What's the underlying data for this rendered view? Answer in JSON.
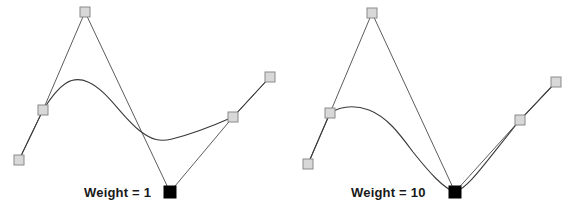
{
  "figure": {
    "background_color": "#ffffff",
    "curve_color": "#3a3a3a",
    "polygon_color": "#4a4a4a",
    "control_point_fill": "#d8d8d8",
    "control_point_stroke": "#8a8a8a",
    "weighted_point_fill": "#000000"
  },
  "panels": [
    {
      "id": "panel-weight-1",
      "caption": "Weight = 1",
      "weight_value": "1",
      "control_points": [
        {
          "name": "cp0",
          "x": 19,
          "y": 160,
          "weighted": false
        },
        {
          "name": "cp1",
          "x": 43,
          "y": 110,
          "weighted": false
        },
        {
          "name": "cp2",
          "x": 85,
          "y": 12,
          "weighted": false
        },
        {
          "name": "cp3",
          "x": 170,
          "y": 192,
          "weighted": true
        },
        {
          "name": "cp4",
          "x": 233,
          "y": 117,
          "weighted": false
        },
        {
          "name": "cp5",
          "x": 270,
          "y": 77,
          "weighted": false
        }
      ],
      "curve_path": "M 19 160 L 43 110 C 60 83 72 75 88 82 C 108 91 120 115 140 131 C 152 140 160 142 172 139 C 192 134 215 125 233 117 L 270 77",
      "polygon_path": "M 19 160 L 43 110 L 85 12 L 170 192 L 233 117 L 270 77"
    },
    {
      "id": "panel-weight-10",
      "caption": "Weight = 10",
      "weight_value": "10",
      "control_points": [
        {
          "name": "cp0",
          "x": 21,
          "y": 164,
          "weighted": false
        },
        {
          "name": "cp1",
          "x": 43,
          "y": 113,
          "weighted": false
        },
        {
          "name": "cp2",
          "x": 85,
          "y": 13,
          "weighted": false
        },
        {
          "name": "cp3",
          "x": 168,
          "y": 192,
          "weighted": true
        },
        {
          "name": "cp4",
          "x": 233,
          "y": 120,
          "weighted": false
        },
        {
          "name": "cp5",
          "x": 269,
          "y": 82,
          "weighted": false
        }
      ],
      "curve_path": "M 21 164 L 43 113 C 56 105 68 105 82 110 C 100 117 112 133 126 152 C 142 172 156 188 168 192 C 182 188 200 160 233 120 L 269 82",
      "polygon_path": "M 21 164 L 43 113 L 85 13 L 168 192 L 233 120 L 269 82"
    }
  ]
}
